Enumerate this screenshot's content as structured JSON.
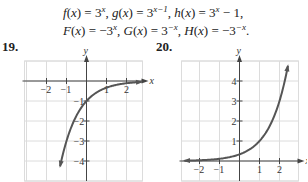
{
  "header": {
    "line1": [
      {
        "fn": "f",
        "rhs_base": "3",
        "rhs_exp": "x",
        "rhs_tail": ""
      },
      {
        "fn": "g",
        "rhs_base": "3",
        "rhs_exp": "x−1",
        "rhs_tail": ""
      },
      {
        "fn": "h",
        "rhs_base": "3",
        "rhs_exp": "x",
        "rhs_tail": " − 1"
      }
    ],
    "line2": [
      {
        "fn": "F",
        "rhs_base": "−3",
        "rhs_exp": "x",
        "rhs_tail": ""
      },
      {
        "fn": "G",
        "rhs_base": "3",
        "rhs_exp": "−x",
        "rhs_tail": ""
      },
      {
        "fn": "H",
        "rhs_base": "−3",
        "rhs_exp": "−x",
        "rhs_tail": ""
      }
    ],
    "line1_end": ",",
    "line2_end": "."
  },
  "problems": {
    "p19": {
      "label": "19."
    },
    "p20": {
      "label": "20."
    }
  },
  "colors": {
    "grid": "#dcdcdc",
    "axis": "#444444",
    "curve": "#555555"
  },
  "chart_data": [
    {
      "type": "line",
      "title": "19.",
      "xlabel": "x",
      "ylabel": "y",
      "xlim": [
        -3.1,
        2.8
      ],
      "ylim": [
        -5,
        1
      ],
      "grid": true,
      "x_ticks": [
        -2,
        -1,
        1,
        2
      ],
      "y_ticks": [
        -1,
        -2,
        -3,
        -4
      ],
      "function": "-3^(-x)",
      "series": [
        {
          "name": "H(x) = -3^(-x)",
          "x": [
            -1.3,
            -1.2,
            -1.0,
            -0.8,
            -0.6,
            -0.4,
            -0.2,
            0,
            0.25,
            0.5,
            0.75,
            1.0,
            1.5,
            2.0,
            2.5,
            2.7
          ],
          "y": [
            -4.17,
            -3.74,
            -3.0,
            -2.41,
            -1.93,
            -1.55,
            -1.25,
            -1.0,
            -0.76,
            -0.58,
            -0.44,
            -0.33,
            -0.19,
            -0.11,
            -0.06,
            -0.05
          ]
        }
      ]
    },
    {
      "type": "line",
      "title": "20.",
      "xlabel": "x",
      "ylabel": "y",
      "xlim": [
        -2.9,
        2.9
      ],
      "ylim": [
        -1,
        5
      ],
      "grid": true,
      "x_ticks": [
        -2,
        -1,
        1,
        2
      ],
      "y_ticks": [
        1,
        2,
        3,
        4
      ],
      "function": "3^(x-1)",
      "series": [
        {
          "name": "g(x) = 3^(x-1)",
          "x": [
            -2.8,
            -2.0,
            -1.0,
            -0.5,
            0,
            0.5,
            1.0,
            1.5,
            2.0,
            2.25,
            2.4
          ],
          "y": [
            0.015,
            0.037,
            0.11,
            0.19,
            0.33,
            0.58,
            1.0,
            1.73,
            3.0,
            3.95,
            4.66
          ]
        }
      ]
    }
  ]
}
